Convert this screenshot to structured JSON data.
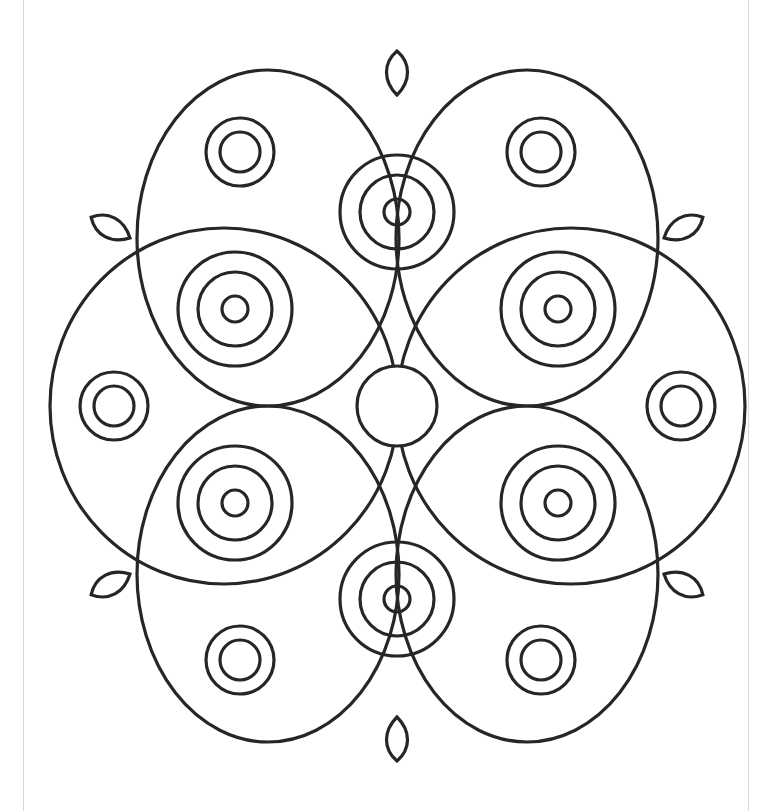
{
  "drawing": {
    "type": "mandala coloring page",
    "stroke_color": "#262626",
    "background": "#ffffff",
    "center": [
      397,
      406
    ],
    "center_circle_r": 40,
    "ellipses": [
      {
        "cx": 268,
        "cy": 238,
        "rx": 131,
        "ry": 168
      },
      {
        "cx": 527,
        "cy": 238,
        "rx": 131,
        "ry": 168
      },
      {
        "cx": 224,
        "cy": 406,
        "rx": 174,
        "ry": 178
      },
      {
        "cx": 571,
        "cy": 406,
        "rx": 174,
        "ry": 178
      },
      {
        "cx": 268,
        "cy": 574,
        "rx": 131,
        "ry": 168
      },
      {
        "cx": 527,
        "cy": 574,
        "rx": 131,
        "ry": 168
      }
    ],
    "double_rings": [
      [
        240,
        152
      ],
      [
        541,
        152
      ],
      [
        114,
        406
      ],
      [
        681,
        406
      ],
      [
        240,
        660
      ],
      [
        541,
        660
      ]
    ],
    "triple_rings": [
      [
        397,
        212
      ],
      [
        235,
        309
      ],
      [
        558,
        309
      ],
      [
        235,
        503
      ],
      [
        558,
        503
      ],
      [
        397,
        599
      ]
    ],
    "leaves": [
      {
        "x": 397,
        "y": 95,
        "angle": 0
      },
      {
        "x": 397,
        "y": 717,
        "angle": 180
      },
      {
        "x": 130,
        "y": 238,
        "angle": -62
      },
      {
        "x": 664,
        "y": 238,
        "angle": 62
      },
      {
        "x": 130,
        "y": 574,
        "angle": -118
      },
      {
        "x": 664,
        "y": 574,
        "angle": 118
      }
    ],
    "page_edges": [
      23,
      748
    ]
  }
}
